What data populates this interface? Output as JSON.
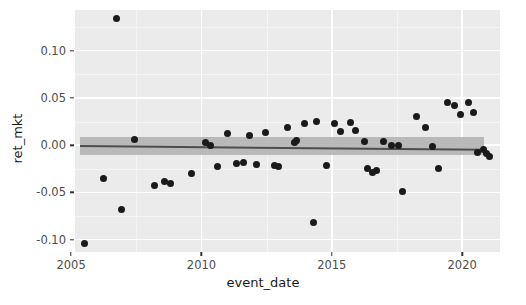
{
  "chart_data": {
    "type": "scatter",
    "title": "",
    "xlabel": "event_date",
    "ylabel": "ret_mkt",
    "xlim": [
      2005.15,
      2021.45
    ],
    "ylim": [
      -0.113,
      0.143
    ],
    "grid": true,
    "legend": null,
    "x_ticks": [
      2005,
      2010,
      2015,
      2020
    ],
    "x_tick_labels": [
      "2005",
      "2010",
      "2015",
      "2020"
    ],
    "y_ticks": [
      0.1,
      0.05,
      0.0,
      -0.05,
      -0.1
    ],
    "y_tick_labels": [
      "0.10",
      "0.05",
      "0.00",
      "-0.05",
      "-0.10"
    ],
    "x_minor_ticks": [
      2007.5,
      2012.5,
      2017.5
    ],
    "y_minor_ticks": [
      0.125,
      0.075,
      0.025,
      -0.025,
      -0.075
    ],
    "point_color": "#1a1a1a",
    "panel_color": "#ebebeb",
    "gridline_color": "#ffffff",
    "fit_line_color": "#4d4d4d",
    "ribbon_color": "#b4b4b4",
    "fit": {
      "type": "linear_regression_with_ci",
      "x_start": 2005.35,
      "x_end": 2020.85,
      "y_start": 0.0005,
      "y_end": -0.0035,
      "ci_half_width_start": 0.0082,
      "ci_half_width_end": 0.0068
    },
    "points": [
      {
        "x": 2005.5,
        "y": -0.1045
      },
      {
        "x": 2006.25,
        "y": -0.0355
      },
      {
        "x": 2006.75,
        "y": 0.1345
      },
      {
        "x": 2006.95,
        "y": -0.068
      },
      {
        "x": 2007.45,
        "y": 0.006
      },
      {
        "x": 2008.2,
        "y": -0.0425
      },
      {
        "x": 2008.6,
        "y": -0.0385
      },
      {
        "x": 2008.8,
        "y": -0.0405
      },
      {
        "x": 2009.6,
        "y": -0.0295
      },
      {
        "x": 2010.15,
        "y": 0.003
      },
      {
        "x": 2010.35,
        "y": -0.0005
      },
      {
        "x": 2010.6,
        "y": -0.0225
      },
      {
        "x": 2011.0,
        "y": 0.012
      },
      {
        "x": 2011.35,
        "y": -0.0195
      },
      {
        "x": 2011.6,
        "y": -0.018
      },
      {
        "x": 2011.85,
        "y": 0.0105
      },
      {
        "x": 2012.1,
        "y": -0.0205
      },
      {
        "x": 2012.45,
        "y": 0.0135
      },
      {
        "x": 2012.8,
        "y": -0.0215
      },
      {
        "x": 2012.95,
        "y": -0.0225
      },
      {
        "x": 2013.3,
        "y": 0.019
      },
      {
        "x": 2013.55,
        "y": 0.003
      },
      {
        "x": 2013.65,
        "y": 0.0045
      },
      {
        "x": 2013.95,
        "y": 0.023
      },
      {
        "x": 2014.3,
        "y": -0.082
      },
      {
        "x": 2014.4,
        "y": 0.025
      },
      {
        "x": 2014.8,
        "y": -0.0215
      },
      {
        "x": 2015.1,
        "y": 0.0225
      },
      {
        "x": 2015.35,
        "y": 0.0145
      },
      {
        "x": 2015.7,
        "y": 0.0235
      },
      {
        "x": 2015.9,
        "y": 0.016
      },
      {
        "x": 2016.25,
        "y": 0.0035
      },
      {
        "x": 2016.35,
        "y": -0.0245
      },
      {
        "x": 2016.55,
        "y": -0.0285
      },
      {
        "x": 2016.7,
        "y": -0.027
      },
      {
        "x": 2017.0,
        "y": 0.004
      },
      {
        "x": 2017.3,
        "y": 0.0
      },
      {
        "x": 2017.55,
        "y": -0.0005
      },
      {
        "x": 2017.7,
        "y": -0.0495
      },
      {
        "x": 2018.25,
        "y": 0.03
      },
      {
        "x": 2018.6,
        "y": 0.019
      },
      {
        "x": 2018.85,
        "y": -0.0015
      },
      {
        "x": 2019.1,
        "y": -0.0245
      },
      {
        "x": 2019.45,
        "y": 0.045
      },
      {
        "x": 2019.7,
        "y": 0.0415
      },
      {
        "x": 2019.95,
        "y": 0.0325
      },
      {
        "x": 2020.25,
        "y": 0.045
      },
      {
        "x": 2020.45,
        "y": 0.035
      },
      {
        "x": 2020.6,
        "y": -0.008
      },
      {
        "x": 2020.8,
        "y": -0.0045
      },
      {
        "x": 2020.95,
        "y": -0.009
      },
      {
        "x": 2021.05,
        "y": -0.0125
      }
    ]
  }
}
